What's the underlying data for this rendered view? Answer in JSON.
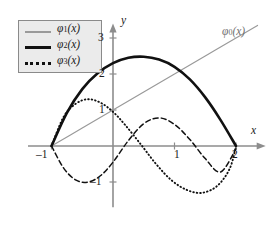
{
  "figure": {
    "axes": {
      "x_axis_label": "x",
      "y_axis_label": "y",
      "x_ticks": [
        {
          "value": -1,
          "label": "–1",
          "px": 47
        },
        {
          "value": 1,
          "label": "1",
          "px": 178
        },
        {
          "value": 2,
          "label": "2",
          "px": 236
        }
      ],
      "y_ticks": [
        {
          "value": 3,
          "label": "3",
          "px": 38
        },
        {
          "value": 2,
          "label": "2",
          "px": 74
        },
        {
          "value": 1,
          "label": "1",
          "px": 110
        },
        {
          "value": -1,
          "label": "–1",
          "px": 182
        }
      ],
      "origin_px": {
        "x": 113,
        "y": 146
      },
      "unit_px": {
        "x": 61.5,
        "y": 36
      },
      "xlim": [
        -1.35,
        2.45
      ],
      "ylim": [
        -1.7,
        3.35
      ],
      "axis_color": "#8d8d8d"
    },
    "legend": {
      "entries": [
        {
          "key": "phi1",
          "label_base": "φ",
          "label_sub": "1",
          "label_arg": "(x)",
          "style": "thin-gray",
          "color": "#9a9a9a"
        },
        {
          "key": "phi2",
          "label_base": "φ",
          "label_sub": "2",
          "label_arg": "(x)",
          "style": "thick-black",
          "color": "#111111"
        },
        {
          "key": "phi3",
          "label_base": "φ",
          "label_sub": "3",
          "label_arg": "(x)",
          "style": "dotted",
          "color": "#111111"
        }
      ],
      "facecolor": "#ebebeb",
      "edgecolor": "#8a8a8a"
    },
    "annotations": [
      {
        "key": "phi0",
        "text": "φ₀(x)",
        "base": "φ",
        "sub": "0",
        "arg": "(x)",
        "color": "#6f6f6f",
        "x_px": 226,
        "y_px": 32
      }
    ]
  },
  "chart_data": {
    "type": "line",
    "title": "",
    "xlabel": "x",
    "ylabel": "y",
    "xlim": [
      -1.35,
      2.45
    ],
    "ylim": [
      -1.7,
      3.35
    ],
    "grid": false,
    "legend_position": "upper-left",
    "x_ticks": [
      -1,
      1,
      2
    ],
    "y_ticks": [
      -1,
      1,
      2,
      3
    ],
    "series": [
      {
        "name": "φ₀(x)",
        "style": "solid-thin-gray",
        "color": "#9a9a9a",
        "labeled_on_plot": true,
        "x": [
          -1.0,
          -0.5,
          0.0,
          0.5,
          1.0,
          1.5,
          2.0,
          2.35
        ],
        "y": [
          0.0,
          0.5,
          1.0,
          1.5,
          2.0,
          2.5,
          3.0,
          3.35
        ]
      },
      {
        "name": "φ₁(x)",
        "style": "dashed-black",
        "color": "#111111",
        "x": [
          -1.0,
          -0.8,
          -0.6,
          -0.4,
          -0.2,
          0.0,
          0.25,
          0.5,
          0.75,
          1.0,
          1.25,
          1.5,
          1.75,
          2.0
        ],
        "y": [
          0.0,
          -0.62,
          -0.95,
          -1.0,
          -0.82,
          -0.45,
          0.15,
          0.62,
          0.78,
          0.6,
          0.18,
          -0.35,
          -0.72,
          -0.08
        ]
      },
      {
        "name": "φ₂(x)",
        "style": "solid-thick-black",
        "color": "#111111",
        "x": [
          -1.0,
          -0.75,
          -0.5,
          -0.25,
          0.0,
          0.25,
          0.5,
          0.75,
          1.0,
          1.25,
          1.5,
          1.75,
          2.0
        ],
        "y": [
          0.0,
          0.92,
          1.58,
          2.02,
          2.3,
          2.45,
          2.48,
          2.4,
          2.2,
          1.85,
          1.35,
          0.72,
          0.0
        ]
      },
      {
        "name": "φ₃(x)",
        "style": "dotted-black",
        "color": "#111111",
        "x": [
          -1.0,
          -0.8,
          -0.6,
          -0.4,
          -0.2,
          0.0,
          0.2,
          0.45,
          0.7,
          0.95,
          1.2,
          1.45,
          1.7,
          1.9,
          2.0
        ],
        "y": [
          0.0,
          0.82,
          1.18,
          1.3,
          1.2,
          0.95,
          0.58,
          0.05,
          -0.5,
          -0.95,
          -1.22,
          -1.3,
          -1.1,
          -0.62,
          0.0
        ]
      }
    ]
  }
}
